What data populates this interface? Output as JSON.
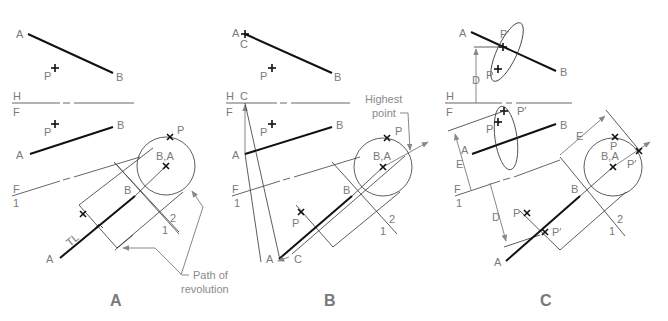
{
  "figure": {
    "panels": [
      {
        "id": "A",
        "caption": "A",
        "labels": {
          "top_A": "A",
          "top_B": "B",
          "top_P": "P",
          "fold_H": "H",
          "fold_F": "F",
          "front_A": "A",
          "front_B": "B",
          "front_P": "P",
          "fold_F1": "F",
          "fold_1": "1",
          "aux_B": "B",
          "aux_A": "A",
          "tl": "TL",
          "end_BA": "B,A",
          "end_P": "P",
          "fold_2": "2",
          "fold_1b": "1"
        },
        "callout": {
          "line1": "Path of",
          "line2": "revolution"
        }
      },
      {
        "id": "B",
        "caption": "B",
        "labels": {
          "top_A": "A",
          "top_C": "C",
          "top_B": "B",
          "top_P": "P",
          "fold_H": "H",
          "fold_C": "C",
          "fold_F": "F",
          "front_A": "A",
          "front_B": "B",
          "front_P": "P",
          "fold_F1": "F",
          "fold_1": "1",
          "aux_B": "B",
          "aux_A": "A",
          "aux_C": "C",
          "aux_P": "P",
          "end_BA": "B,A",
          "end_P": "P",
          "fold_2": "2",
          "fold_1b": "1"
        },
        "callout": {
          "line1": "Highest",
          "line2": "point"
        }
      },
      {
        "id": "C",
        "caption": "C",
        "labels": {
          "top_A": "A",
          "top_B": "B",
          "top_P": "P",
          "top_Pp": "P′",
          "dim_D": "D",
          "fold_H": "H",
          "fold_F": "F",
          "front_A": "A",
          "front_B": "B",
          "front_P": "P",
          "front_Pp": "P′",
          "dim_E": "E",
          "fold_F1": "F",
          "fold_1": "1",
          "aux_B": "B",
          "aux_A": "A",
          "aux_P": "P",
          "aux_Pp": "P′",
          "dim_D2": "D",
          "end_BA": "B,A",
          "end_P": "P",
          "end_Pp": "P′",
          "dim_E2": "E",
          "fold_2": "2",
          "fold_1b": "1"
        }
      }
    ]
  }
}
